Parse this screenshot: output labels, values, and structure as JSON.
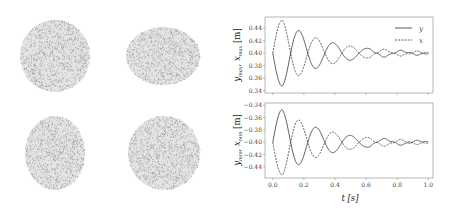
{
  "figure": {
    "left_panel": {
      "description": "Four particle-cloud snapshots of an oscillating droplet",
      "snapshots": [
        {
          "id": "top-left",
          "cx": 55,
          "cy": 56,
          "rx": 35,
          "ry": 36,
          "shape": "circle"
        },
        {
          "id": "top-right",
          "cx": 163,
          "cy": 56,
          "rx": 37,
          "ry": 29,
          "shape": "horizontal-ellipse"
        },
        {
          "id": "bottom-left",
          "cx": 55,
          "cy": 153,
          "rx": 30,
          "ry": 37,
          "shape": "vertical-ellipse"
        },
        {
          "id": "bottom-right",
          "cx": 164,
          "cy": 153,
          "rx": 36,
          "ry": 37,
          "shape": "circle"
        }
      ],
      "dot_color": "#8a8a8a"
    }
  },
  "chart_data": [
    {
      "type": "line",
      "title": "",
      "xlabel": "",
      "ylabel": "y_max, x_max [m]",
      "ylabel_parts": {
        "main": "y",
        "sub1": "max",
        "sep": ", ",
        "main2": "x",
        "sub2": "max",
        "unit": "[m]"
      },
      "xlim": [
        -0.05,
        1.03
      ],
      "ylim": [
        0.336,
        0.458
      ],
      "xticks": [
        0.0,
        0.2,
        0.4,
        0.6,
        0.8,
        1.0
      ],
      "xtick_labels": [
        "",
        "",
        "",
        "",
        "",
        ""
      ],
      "yticks": [
        0.34,
        0.36,
        0.38,
        0.4,
        0.42,
        0.44
      ],
      "ytick_labels": [
        "0.34",
        "0.36",
        "0.38",
        "0.40",
        "0.42",
        "0.44"
      ],
      "grid": false,
      "legend_position": "upper right",
      "legend": [
        {
          "label": "y",
          "style": "solid"
        },
        {
          "label": "x",
          "style": "dashed"
        }
      ],
      "model": {
        "baseline": 0.4,
        "amplitude": 0.053,
        "half_period": 0.11,
        "decay_per_half": 0.68,
        "first_peak_t": 0.06
      },
      "series": [
        {
          "name": "y",
          "style": "solid",
          "sign": -1,
          "peaks": [
            [
              0.06,
              0.347
            ],
            [
              0.17,
              0.436
            ],
            [
              0.28,
              0.378
            ],
            [
              0.39,
              0.411
            ],
            [
              0.5,
              0.393
            ],
            [
              0.61,
              0.405
            ]
          ]
        },
        {
          "name": "x",
          "style": "dashed",
          "sign": 1,
          "peaks": [
            [
              0.06,
              0.453
            ],
            [
              0.17,
              0.364
            ],
            [
              0.28,
              0.422
            ],
            [
              0.39,
              0.389
            ],
            [
              0.5,
              0.407
            ],
            [
              0.61,
              0.395
            ]
          ]
        }
      ]
    },
    {
      "type": "line",
      "title": "",
      "xlabel": "t [s]",
      "ylabel": "y_min, x_min [m]",
      "ylabel_parts": {
        "main": "y",
        "sub1": "min",
        "sep": ", ",
        "main2": "x",
        "sub2": "min",
        "unit": "[m]"
      },
      "xlim": [
        -0.05,
        1.03
      ],
      "ylim": [
        -0.458,
        -0.336
      ],
      "xticks": [
        0.0,
        0.2,
        0.4,
        0.6,
        0.8,
        1.0
      ],
      "xtick_labels": [
        "0.0",
        "0.2",
        "0.4",
        "0.6",
        "0.8",
        "1.0"
      ],
      "yticks": [
        -0.34,
        -0.36,
        -0.38,
        -0.4,
        -0.42,
        -0.44
      ],
      "ytick_labels": [
        "−0.34",
        "−0.36",
        "−0.38",
        "−0.40",
        "−0.42",
        "−0.44"
      ],
      "grid": false,
      "model": {
        "baseline": -0.4,
        "amplitude": 0.053,
        "half_period": 0.11,
        "decay_per_half": 0.68,
        "first_peak_t": 0.06
      },
      "series": [
        {
          "name": "y",
          "style": "solid",
          "sign": 1,
          "peaks": [
            [
              0.06,
              -0.347
            ],
            [
              0.17,
              -0.436
            ],
            [
              0.28,
              -0.378
            ],
            [
              0.39,
              -0.411
            ],
            [
              0.5,
              -0.393
            ],
            [
              0.61,
              -0.405
            ]
          ]
        },
        {
          "name": "x",
          "style": "dashed",
          "sign": -1,
          "peaks": [
            [
              0.06,
              -0.453
            ],
            [
              0.17,
              -0.364
            ],
            [
              0.28,
              -0.422
            ],
            [
              0.39,
              -0.389
            ],
            [
              0.5,
              -0.407
            ],
            [
              0.61,
              -0.395
            ]
          ]
        }
      ]
    }
  ],
  "labels": {
    "xlabel": "t [s]",
    "legend_y": "y",
    "legend_x": "x"
  }
}
